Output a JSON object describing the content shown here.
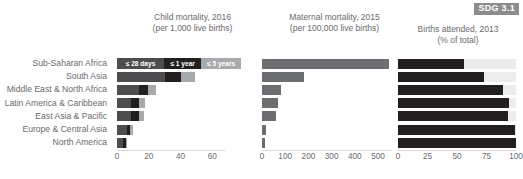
{
  "badge": {
    "label": "SDG 3.1",
    "bg": "#8c8c8e",
    "fg": "#ffffff"
  },
  "regions": [
    "Sub-Saharan Africa",
    "South Asia",
    "Middle East & North Africa",
    "Latin America & Caribbean",
    "East Asia & Pacific",
    "Europe & Central Asia",
    "North America"
  ],
  "panels": [
    {
      "title": "Child mortality, 2016\n(per 1,000 live births)",
      "axis_label": "",
      "ticks": [
        0,
        20,
        40,
        60
      ],
      "xmax": 68,
      "legend_row": 0,
      "legend": [
        {
          "label": "≤ 28 days",
          "color": "#4d4d4f"
        },
        {
          "label": "≤ 1 year",
          "color": "#231f20"
        },
        {
          "label": "≤ 5 years",
          "color": "#a7a9ac"
        }
      ]
    },
    {
      "title": "Maternal mortality, 2015\n(per 100,000 live births)",
      "axis_label": "",
      "ticks": [
        0,
        100,
        200,
        300,
        400,
        500
      ],
      "xmax": 560,
      "color": "#6d6e71"
    },
    {
      "title": "Births attended, 2013\n(% of total)",
      "axis_label": "",
      "ticks": [
        0,
        25,
        50,
        75,
        100
      ],
      "xmax": 100,
      "color": "#231f20",
      "track_color": "#ececec"
    }
  ],
  "chart_data": [
    {
      "type": "bar",
      "title": "Child mortality, 2016 (per 1,000 live births)",
      "subtitle": "per 1,000 live births",
      "orientation": "horizontal",
      "stacked": true,
      "xlabel": "",
      "ylabel": "",
      "xlim": [
        0,
        68
      ],
      "ticks": [
        0,
        20,
        40,
        60
      ],
      "grid": false,
      "legend": [
        "≤ 28 days",
        "≤ 1 year",
        "≤ 5 years"
      ],
      "legend_position": "top-row-inline",
      "categories": [
        "Sub-Saharan Africa",
        "South Asia",
        "Middle East & North Africa",
        "Latin America & Caribbean",
        "East Asia & Pacific",
        "Europe & Central Asia",
        "North America"
      ],
      "series": [
        {
          "name": "≤ 28 days",
          "values": [
            28,
            30,
            14,
            9,
            9,
            6,
            4
          ]
        },
        {
          "name": "≤ 1 year",
          "values": [
            0,
            10,
            5.5,
            5,
            5,
            2.5,
            1.5
          ]
        },
        {
          "name": "≤ 5 years",
          "values": [
            0,
            9,
            5,
            3.5,
            3,
            1.5,
            0.5
          ]
        }
      ],
      "totals": [
        78,
        49,
        24.5,
        17.5,
        17,
        10,
        6
      ]
    },
    {
      "type": "bar",
      "title": "Maternal mortality, 2015 (per 100,000 live births)",
      "orientation": "horizontal",
      "stacked": false,
      "xlabel": "",
      "ylabel": "",
      "xlim": [
        0,
        560
      ],
      "ticks": [
        0,
        100,
        200,
        300,
        400,
        500
      ],
      "grid": false,
      "categories": [
        "Sub-Saharan Africa",
        "South Asia",
        "Middle East & North Africa",
        "Latin America & Caribbean",
        "East Asia & Pacific",
        "Europe & Central Asia",
        "North America"
      ],
      "values": [
        546,
        182,
        81,
        68,
        62,
        16,
        13
      ]
    },
    {
      "type": "bar",
      "title": "Births attended, 2013 (% of total)",
      "orientation": "horizontal",
      "stacked": false,
      "xlabel": "",
      "ylabel": "",
      "xlim": [
        0,
        100
      ],
      "ticks": [
        0,
        25,
        50,
        75,
        100
      ],
      "grid": false,
      "categories": [
        "Sub-Saharan Africa",
        "South Asia",
        "Middle East & North Africa",
        "Latin America & Caribbean",
        "East Asia & Pacific",
        "Europe & Central Asia",
        "North America"
      ],
      "values": [
        56,
        73,
        89,
        94,
        93,
        99,
        100
      ]
    }
  ]
}
